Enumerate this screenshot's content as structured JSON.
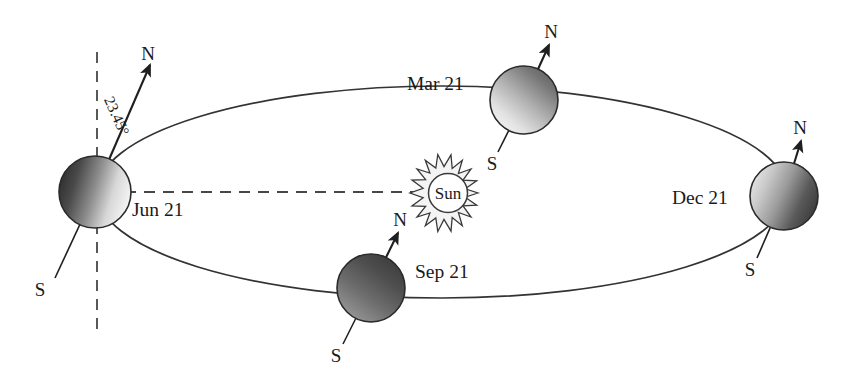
{
  "diagram": {
    "sun": {
      "label": "Sun",
      "icon": "sun-starburst-icon",
      "cx": 448,
      "cy": 193,
      "inner_radius": 19,
      "outer_radius": 30,
      "ray_count": 16
    },
    "orbit": {
      "cx": 442,
      "cy": 192,
      "rx": 345,
      "ry": 106,
      "stroke": "#333333"
    },
    "tilt": {
      "label": "23.45°",
      "value_degrees": 23.45,
      "axis_dash_note": "vertical dashed reference axis through Jun 21 Earth"
    },
    "pole_labels": {
      "north": "N",
      "south": "S"
    },
    "positions": [
      {
        "id": "jun21",
        "label": "Jun 21",
        "cx": 95,
        "cy": 192,
        "r": 36,
        "label_x": 132,
        "label_y": 216,
        "north_label_x": 148,
        "north_label_y": 60,
        "south_label_x": 40,
        "south_label_y": 296,
        "axis_n_x": 150,
        "axis_n_y": 65,
        "axis_s_x": 55,
        "axis_s_y": 278,
        "shading": "dark-left-light-right"
      },
      {
        "id": "mar21",
        "label": "Mar 21",
        "cx": 524,
        "cy": 100,
        "r": 34,
        "label_x": 407,
        "label_y": 90,
        "north_label_x": 544,
        "north_label_y": 38,
        "south_label_x": 485,
        "south_label_y": 170,
        "axis_n_x": 549,
        "axis_n_y": 45,
        "axis_s_x": 498,
        "axis_s_y": 152,
        "shading": "dark-top-right-light-bottom-left"
      },
      {
        "id": "sep21",
        "label": "Sep 21",
        "cx": 371,
        "cy": 288,
        "r": 34,
        "label_x": 415,
        "label_y": 278,
        "north_label_x": 393,
        "north_label_y": 226,
        "south_label_x": 328,
        "south_label_y": 362,
        "axis_n_x": 398,
        "axis_n_y": 233,
        "axis_s_x": 343,
        "axis_s_y": 344,
        "shading": "dark-top-light-bottom"
      },
      {
        "id": "dec21",
        "label": "Dec 21",
        "cx": 784,
        "cy": 196,
        "r": 34,
        "label_x": 672,
        "label_y": 204,
        "north_label_x": 795,
        "north_label_y": 134,
        "south_label_x": 744,
        "south_label_y": 276,
        "axis_n_x": 801,
        "axis_n_y": 141,
        "axis_s_x": 757,
        "axis_s_y": 258,
        "shading": "light-left-dark-right"
      }
    ],
    "colors": {
      "line": "#333333",
      "text": "#1a1a1a",
      "dash": "#444444",
      "earth_dark": "#3a3a3a",
      "earth_light": "#f2f2f2",
      "background": "#ffffff"
    }
  }
}
